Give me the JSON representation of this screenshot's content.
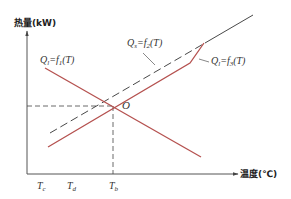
{
  "axes": {
    "y_label": "热量(kW)",
    "x_label": "温度(℃)"
  },
  "curves": [
    {
      "id": "f1",
      "label_prefix": "Q",
      "label_sub": "l",
      "label_mid": "=f",
      "label_fsub": "1",
      "label_suffix": "(T)",
      "style": "solid",
      "color": "#b5514f",
      "trend": "decreasing"
    },
    {
      "id": "f2",
      "label_prefix": "Q",
      "label_sub": "s",
      "label_mid": "=f",
      "label_fsub": "2",
      "label_suffix": "(T)",
      "style": "dashed",
      "color": "#333333",
      "trend": "increasing"
    },
    {
      "id": "f3",
      "label_prefix": "Q",
      "label_sub": "l",
      "label_mid": "=f",
      "label_fsub": "3",
      "label_suffix": "(T)",
      "style": "solid",
      "color": "#b5514f",
      "trend": "increasing-with-kink"
    }
  ],
  "intersection": {
    "label": "O"
  },
  "x_ticks": [
    {
      "main": "T",
      "sub": "c"
    },
    {
      "main": "T",
      "sub": "d"
    },
    {
      "main": "T",
      "sub": "b"
    }
  ],
  "colors": {
    "axis": "#555555",
    "red_curve": "#b5514f",
    "dashed_curve": "#333333"
  }
}
